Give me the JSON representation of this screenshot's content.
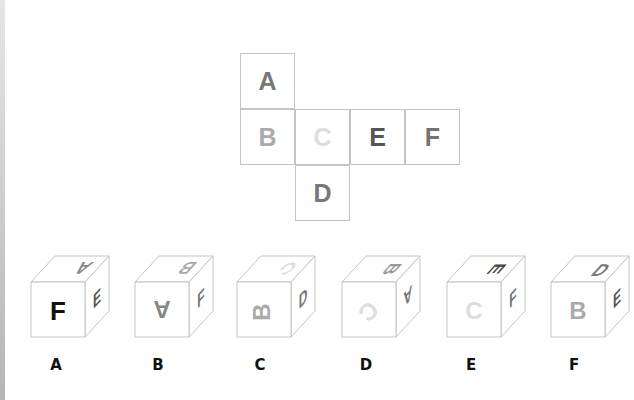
{
  "net": {
    "cells": [
      {
        "letter": "A",
        "color": "#777777",
        "x": 240,
        "y": 53
      },
      {
        "letter": "B",
        "color": "#aaaaaa",
        "x": 240,
        "y": 109
      },
      {
        "letter": "C",
        "color": "#dddddd",
        "x": 295,
        "y": 109
      },
      {
        "letter": "E",
        "color": "#555555",
        "x": 350,
        "y": 109
      },
      {
        "letter": "F",
        "color": "#737373",
        "x": 405,
        "y": 109
      },
      {
        "letter": "D",
        "color": "#777777",
        "x": 295,
        "y": 165
      }
    ]
  },
  "options": [
    {
      "label": "A",
      "front": "F",
      "top": "A",
      "right": "E",
      "top_orientation": "upside-down",
      "right_orientation": "normal"
    },
    {
      "label": "B",
      "front": "A",
      "top": "B",
      "right": "F",
      "front_orientation": "upside-down",
      "top_orientation": "upside-down",
      "right_orientation": "normal"
    },
    {
      "label": "C",
      "front": "B",
      "top": "C",
      "right": "D",
      "front_orientation": "rotated-90",
      "top_orientation": "rotated",
      "right_orientation": "normal"
    },
    {
      "label": "D",
      "front": "C",
      "top": "B",
      "right": "A",
      "front_orientation": "rotated",
      "top_orientation": "rotated-90",
      "right_orientation": "upside-down"
    },
    {
      "label": "E",
      "front": "C",
      "top": "E",
      "right": "F",
      "top_orientation": "rotated-90",
      "right_orientation": "normal"
    },
    {
      "label": "F",
      "front": "B",
      "top": "D",
      "right": "E",
      "top_orientation": "normal",
      "right_orientation": "normal"
    }
  ]
}
